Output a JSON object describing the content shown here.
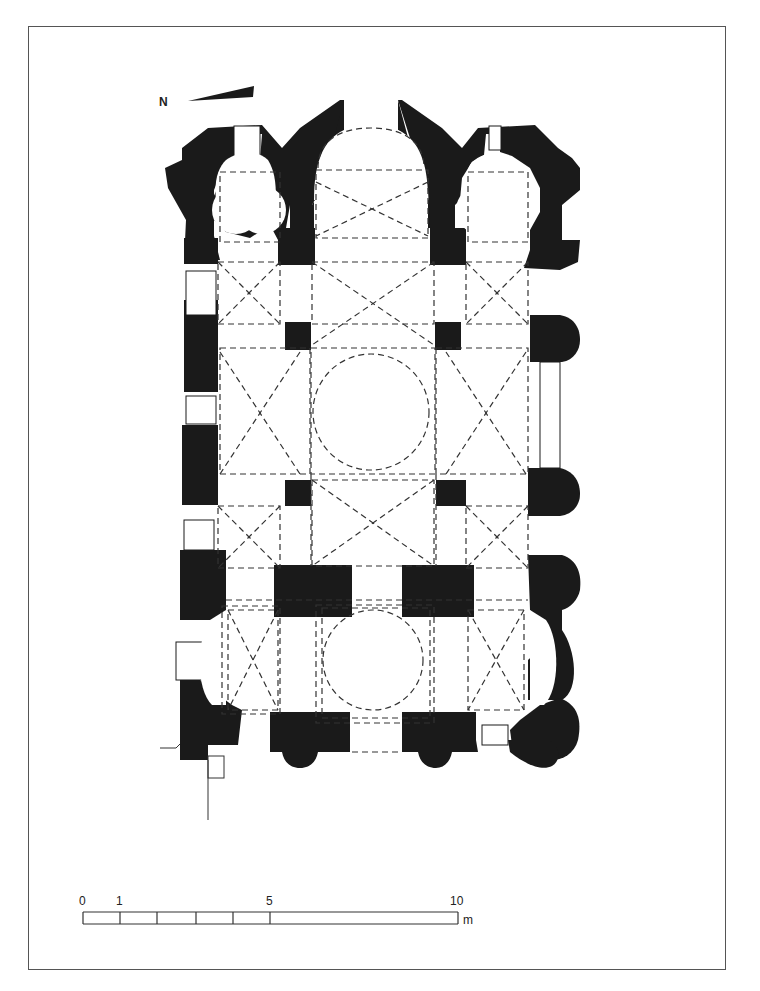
{
  "figure": {
    "type": "architectural floor plan"
  },
  "north_arrow": {
    "label": "N"
  },
  "scale_bar": {
    "ticks": [
      "0",
      "1",
      "5",
      "10"
    ],
    "unit": "m",
    "divisions": [
      0,
      1,
      2,
      3,
      4,
      5,
      10
    ]
  },
  "legend_semantics": {
    "solid_black": "walls and piers",
    "dashed_lines": "vaults, arches and dome outlines overhead"
  },
  "colors": {
    "wall": "#1a1a1a",
    "paper": "#ffffff",
    "frame": "#555555"
  }
}
